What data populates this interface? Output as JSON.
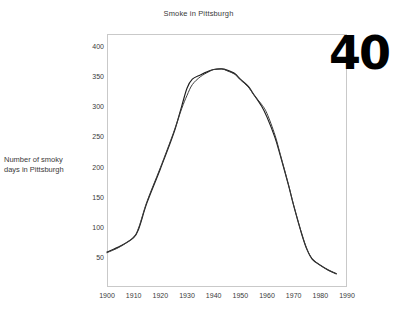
{
  "page_number": "40",
  "chart_data": {
    "type": "line",
    "title": "Smoke in Pittsburgh",
    "xlabel": "",
    "ylabel": "Number of smoky days in Pittsburgh",
    "ylabel_lines": [
      "Number of smoky",
      "days in Pittsburgh"
    ],
    "xlim": [
      1900,
      1990
    ],
    "ylim": [
      0,
      420
    ],
    "grid": false,
    "legend": "none",
    "x_ticks": [
      1900,
      1910,
      1920,
      1930,
      1940,
      1950,
      1960,
      1970,
      1980,
      1990
    ],
    "x_tick_labels": [
      "1900",
      "1910",
      "1920",
      "1930",
      "1940",
      "1950",
      "1960",
      "1970",
      "1980",
      "1990"
    ],
    "y_ticks": [
      50,
      100,
      150,
      200,
      250,
      300,
      350,
      400
    ],
    "y_tick_labels": [
      "50",
      "100",
      "150",
      "200",
      "250",
      "300",
      "350",
      "400"
    ],
    "x": [
      1900,
      1905,
      1910,
      1912,
      1915,
      1920,
      1925,
      1928,
      1930,
      1932,
      1935,
      1938,
      1940,
      1943,
      1945,
      1948,
      1950,
      1953,
      1955,
      1958,
      1960,
      1963,
      1965,
      1968,
      1970,
      1973,
      1975,
      1977,
      1980,
      1983,
      1986
    ],
    "series": [
      {
        "name": "Smoky days (observed)",
        "color": "#1c1c1c",
        "values": [
          58,
          68,
          82,
          98,
          140,
          196,
          255,
          300,
          330,
          345,
          352,
          358,
          361,
          362,
          360,
          354,
          345,
          333,
          320,
          300,
          282,
          248,
          218,
          170,
          135,
          88,
          62,
          46,
          36,
          28,
          22
        ]
      },
      {
        "name": "Smoothed trend",
        "color": "#3a3a3a",
        "values": [
          57,
          67,
          83,
          100,
          142,
          198,
          257,
          296,
          318,
          336,
          349,
          357,
          361,
          362,
          359,
          353,
          344,
          332,
          319,
          303,
          288,
          252,
          220,
          171,
          136,
          89,
          63,
          47,
          36,
          28,
          22
        ]
      }
    ]
  }
}
